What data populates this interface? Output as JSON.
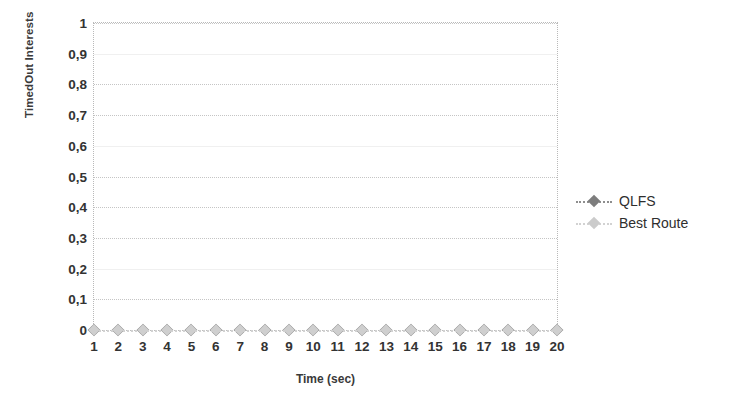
{
  "chart_data": {
    "type": "line",
    "title": "",
    "subtitle": "",
    "xlabel": "Time (sec)",
    "ylabel": "TimedOut Interests",
    "x": [
      1,
      2,
      3,
      4,
      5,
      6,
      7,
      8,
      9,
      10,
      11,
      12,
      13,
      14,
      15,
      16,
      17,
      18,
      19,
      20
    ],
    "xtick_labels": [
      "1",
      "2",
      "3",
      "4",
      "5",
      "6",
      "7",
      "8",
      "9",
      "10",
      "11",
      "12",
      "13",
      "14",
      "15",
      "16",
      "17",
      "18",
      "19",
      "20"
    ],
    "xlim": [
      1,
      20
    ],
    "ylim": [
      0,
      1
    ],
    "ytick_values": [
      1,
      0.9,
      0.8,
      0.7,
      0.6,
      0.5,
      0.4,
      0.3,
      0.2,
      0.1,
      0
    ],
    "ytick_labels": [
      "1",
      "0,9",
      "0,8",
      "0,7",
      "0,6",
      "0,5",
      "0,4",
      "0,3",
      "0,2",
      "0,1",
      "0"
    ],
    "decimal_separator": ",",
    "grid": true,
    "grid_style": "dotted",
    "grid_axis": "y",
    "legend_position": "right",
    "series": [
      {
        "name": "QLFS",
        "color": "#8e8e8e",
        "marker": "diamond",
        "values": [
          0,
          0,
          0,
          0,
          0,
          0,
          0,
          0,
          0,
          0,
          0,
          0,
          0,
          0,
          0,
          0,
          0,
          0,
          0,
          0
        ]
      },
      {
        "name": "Best Route",
        "color": "#cfcfcf",
        "marker": "diamond",
        "values": [
          0,
          0,
          0,
          0,
          0,
          0,
          0,
          0,
          0,
          0,
          0,
          0,
          0,
          0,
          0,
          0,
          0,
          0,
          0,
          0
        ]
      }
    ]
  },
  "legend": {
    "items": [
      {
        "label": "QLFS"
      },
      {
        "label": "Best Route"
      }
    ]
  },
  "colors": {
    "series_qlfs": "#8e8e8e",
    "series_best_route": "#cfcfcf",
    "grid": "#c5c5c5",
    "text": "#333333",
    "background": "#ffffff"
  }
}
